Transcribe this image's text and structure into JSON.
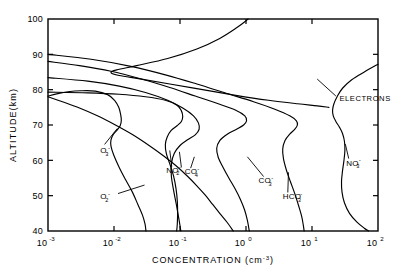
{
  "chart_data": {
    "type": "line",
    "title": "",
    "xlabel": "CONCENTRATION (cm-3)",
    "xlabel_main": "CONCENTRATION (cm",
    "xlabel_sup": "-3",
    "xlabel_tail": ")",
    "ylabel": "ALTITUDE(km)",
    "xscale": "log",
    "yscale": "linear",
    "xlim": [
      0.001,
      100
    ],
    "ylim": [
      40,
      100
    ],
    "grid": false,
    "legend": "inline-labels",
    "xticks": [
      {
        "value": 0.001,
        "mantissa": "10",
        "exponent": "-3"
      },
      {
        "value": 0.01,
        "mantissa": "10",
        "exponent": "-2"
      },
      {
        "value": 0.1,
        "mantissa": "10",
        "exponent": "-1"
      },
      {
        "value": 1,
        "mantissa": "10",
        "exponent": "0"
      },
      {
        "value": 10,
        "mantissa": "10",
        "exponent": "1"
      },
      {
        "value": 100,
        "mantissa": "10",
        "exponent": "2"
      }
    ],
    "yticks": [
      {
        "value": 40,
        "label": "40"
      },
      {
        "value": 50,
        "label": "50"
      },
      {
        "value": 60,
        "label": "60"
      },
      {
        "value": 70,
        "label": "70"
      },
      {
        "value": 80,
        "label": "80"
      },
      {
        "value": 90,
        "label": "90"
      },
      {
        "value": 100,
        "label": "100"
      }
    ],
    "series": [
      {
        "name": "O3-",
        "label_base": "O",
        "label_sub": "3",
        "label_sup": "-",
        "label_x": 0.0062,
        "label_y": 62.0,
        "points": [
          [
            0.001,
            78.2
          ],
          [
            0.00135,
            78.8
          ],
          [
            0.002,
            79.4
          ],
          [
            0.0032,
            79.7
          ],
          [
            0.0052,
            79.6
          ],
          [
            0.008,
            78.6
          ],
          [
            0.0102,
            77.0
          ],
          [
            0.0118,
            75.0
          ],
          [
            0.0126,
            73.0
          ],
          [
            0.0129,
            71.3
          ],
          [
            0.0124,
            69.8
          ],
          [
            0.0112,
            68.6
          ],
          [
            0.0098,
            67.4
          ],
          [
            0.009,
            65.8
          ],
          [
            0.009,
            64.0
          ],
          [
            0.0099,
            61.5
          ],
          [
            0.012,
            58.0
          ],
          [
            0.015,
            54.5
          ],
          [
            0.019,
            51.0
          ],
          [
            0.023,
            47.5
          ],
          [
            0.027,
            44.5
          ],
          [
            0.0295,
            42.0
          ],
          [
            0.0305,
            40.0
          ]
        ]
      },
      {
        "name": "O2-",
        "label_base": "O",
        "label_sub": "2",
        "label_sup": "-",
        "label_x": 0.0062,
        "label_y": 49.0,
        "points": [
          [
            0.001,
            78.0
          ],
          [
            0.0017,
            76.5
          ],
          [
            0.003,
            74.8
          ],
          [
            0.0056,
            72.6
          ],
          [
            0.0105,
            70.0
          ],
          [
            0.019,
            67.3
          ],
          [
            0.034,
            64.2
          ],
          [
            0.056,
            61.3
          ],
          [
            0.088,
            58.4
          ],
          [
            0.13,
            55.5
          ],
          [
            0.18,
            52.8
          ],
          [
            0.24,
            50.2
          ],
          [
            0.31,
            47.6
          ],
          [
            0.4,
            45.0
          ],
          [
            0.52,
            42.4
          ],
          [
            0.64,
            40.0
          ]
        ]
      },
      {
        "name": "NO2-",
        "label_base": "NO",
        "label_sub": "2",
        "label_sup": "-",
        "label_x": 0.062,
        "label_y": 56.5,
        "points": [
          [
            0.001,
            79.3
          ],
          [
            0.004,
            79.1
          ],
          [
            0.012,
            78.7
          ],
          [
            0.03,
            78.0
          ],
          [
            0.06,
            77.0
          ],
          [
            0.09,
            75.6
          ],
          [
            0.105,
            74.0
          ],
          [
            0.11,
            72.4
          ],
          [
            0.105,
            71.0
          ],
          [
            0.09,
            69.8
          ],
          [
            0.073,
            68.4
          ],
          [
            0.064,
            66.6
          ],
          [
            0.06,
            64.5
          ],
          [
            0.062,
            62.0
          ],
          [
            0.07,
            59.0
          ],
          [
            0.08,
            55.5
          ],
          [
            0.087,
            52.0
          ],
          [
            0.091,
            48.5
          ],
          [
            0.092,
            45.0
          ],
          [
            0.091,
            42.0
          ],
          [
            0.089,
            40.0
          ]
        ]
      },
      {
        "name": "CO4-",
        "label_base": "CO",
        "label_sub": "4",
        "label_sup": "-",
        "label_x": 0.118,
        "label_y": 56.0,
        "points": [
          [
            0.001,
            83.4
          ],
          [
            0.004,
            82.4
          ],
          [
            0.012,
            81.0
          ],
          [
            0.03,
            79.2
          ],
          [
            0.065,
            77.0
          ],
          [
            0.11,
            74.8
          ],
          [
            0.16,
            72.6
          ],
          [
            0.19,
            70.6
          ],
          [
            0.195,
            68.8
          ],
          [
            0.17,
            67.2
          ],
          [
            0.13,
            65.8
          ],
          [
            0.1,
            64.2
          ],
          [
            0.082,
            62.0
          ],
          [
            0.074,
            59.0
          ],
          [
            0.074,
            55.5
          ],
          [
            0.08,
            51.5
          ],
          [
            0.088,
            47.5
          ],
          [
            0.095,
            44.0
          ],
          [
            0.1,
            41.5
          ],
          [
            0.103,
            40.0
          ]
        ]
      },
      {
        "name": "CO3-",
        "label_base": "CO",
        "label_sub": "3",
        "label_sup": "-",
        "label_x": 1.55,
        "label_y": 53.5,
        "points": [
          [
            0.001,
            88.0
          ],
          [
            0.003,
            86.8
          ],
          [
            0.009,
            85.2
          ],
          [
            0.026,
            83.0
          ],
          [
            0.07,
            80.6
          ],
          [
            0.17,
            78.2
          ],
          [
            0.38,
            76.0
          ],
          [
            0.7,
            74.2
          ],
          [
            0.96,
            72.6
          ],
          [
            1.02,
            71.2
          ],
          [
            0.92,
            70.0
          ],
          [
            0.72,
            68.8
          ],
          [
            0.52,
            67.4
          ],
          [
            0.4,
            65.6
          ],
          [
            0.36,
            63.4
          ],
          [
            0.38,
            60.8
          ],
          [
            0.45,
            58.0
          ],
          [
            0.55,
            55.0
          ],
          [
            0.68,
            52.0
          ],
          [
            0.82,
            49.0
          ],
          [
            0.95,
            46.0
          ],
          [
            1.05,
            43.0
          ],
          [
            1.12,
            40.0
          ]
        ]
      },
      {
        "name": "HCO3-",
        "label_base": "HCO",
        "label_sub": "3",
        "label_sup": "-",
        "label_x": 3.6,
        "label_y": 49.0,
        "points": [
          [
            0.001,
            90.0
          ],
          [
            0.0045,
            88.6
          ],
          [
            0.018,
            86.6
          ],
          [
            0.06,
            84.2
          ],
          [
            0.18,
            81.6
          ],
          [
            0.5,
            79.0
          ],
          [
            1.3,
            76.6
          ],
          [
            2.8,
            74.4
          ],
          [
            4.6,
            72.6
          ],
          [
            5.8,
            71.2
          ],
          [
            6.0,
            70.0
          ],
          [
            5.5,
            68.8
          ],
          [
            4.6,
            67.4
          ],
          [
            3.9,
            65.6
          ],
          [
            3.6,
            63.2
          ],
          [
            3.7,
            60.4
          ],
          [
            4.1,
            57.2
          ],
          [
            4.7,
            54.0
          ],
          [
            5.5,
            50.5
          ],
          [
            6.3,
            47.0
          ],
          [
            7.0,
            44.0
          ],
          [
            7.4,
            41.5
          ],
          [
            7.6,
            40.0
          ]
        ]
      },
      {
        "name": "NO3-",
        "label_base": "NO",
        "label_sub": "3",
        "label_sup": "-",
        "label_x": 33.0,
        "label_y": 58.5,
        "points": [
          [
            100.0,
            87.2
          ],
          [
            62.0,
            85.0
          ],
          [
            40.0,
            82.8
          ],
          [
            29.0,
            80.4
          ],
          [
            24.0,
            78.0
          ],
          [
            21.5,
            76.0
          ],
          [
            20.5,
            74.2
          ],
          [
            21.0,
            72.6
          ],
          [
            23.0,
            71.0
          ],
          [
            26.0,
            69.4
          ],
          [
            29.0,
            67.6
          ],
          [
            31.0,
            65.4
          ],
          [
            31.5,
            62.8
          ],
          [
            30.5,
            60.0
          ],
          [
            29.0,
            57.0
          ],
          [
            28.0,
            54.0
          ],
          [
            28.5,
            51.0
          ],
          [
            31.0,
            48.0
          ],
          [
            37.0,
            45.0
          ],
          [
            48.0,
            42.5
          ],
          [
            62.0,
            40.8
          ],
          [
            72.0,
            40.0
          ]
        ]
      },
      {
        "name": "ELECTRONS",
        "label_base": "ELECTRONS",
        "label_sub": "",
        "label_sup": "",
        "label_x": 26.0,
        "label_y": 76.8,
        "points": [
          [
            1.08,
            100.0
          ],
          [
            0.72,
            97.5
          ],
          [
            0.4,
            94.5
          ],
          [
            0.18,
            91.5
          ],
          [
            0.065,
            88.8
          ],
          [
            0.022,
            86.8
          ],
          [
            0.011,
            85.6
          ],
          [
            0.009,
            84.8
          ],
          [
            0.012,
            84.0
          ],
          [
            0.026,
            83.0
          ],
          [
            0.07,
            81.6
          ],
          [
            0.22,
            80.0
          ],
          [
            0.7,
            78.4
          ],
          [
            2.2,
            77.0
          ],
          [
            6.0,
            76.0
          ],
          [
            12.0,
            75.4
          ],
          [
            18.0,
            75.0
          ]
        ]
      }
    ],
    "annotations": []
  }
}
